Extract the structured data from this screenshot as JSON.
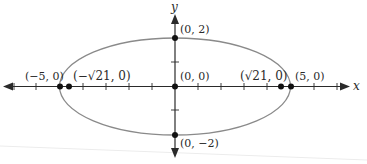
{
  "figure": {
    "type": "ellipse-with-foci",
    "equation_implied": "x^2/25 + y^2/4 = 1",
    "axes": {
      "x_label": "x",
      "y_label": "y",
      "x_ticks": [
        -7,
        -6,
        -5,
        -4,
        -3,
        -2,
        -1,
        1,
        2,
        3,
        4,
        5,
        6,
        7
      ],
      "y_ticks": [
        -2,
        -1,
        1,
        2
      ]
    },
    "ellipse": {
      "center": [
        0,
        0
      ],
      "a": 5,
      "b": 2
    },
    "points": [
      {
        "id": "vertex-left",
        "x": -5,
        "y": 0,
        "label": "(−5, 0)"
      },
      {
        "id": "focus-left",
        "x": -4.583,
        "y": 0,
        "label": "(−√21, 0)"
      },
      {
        "id": "center",
        "x": 0,
        "y": 0,
        "label": "(0, 0)"
      },
      {
        "id": "focus-right",
        "x": 4.583,
        "y": 0,
        "label": "(√21, 0)"
      },
      {
        "id": "vertex-right",
        "x": 5,
        "y": 0,
        "label": "(5, 0)"
      },
      {
        "id": "co-vertex-top",
        "x": 0,
        "y": 2,
        "label": "(0, 2)"
      },
      {
        "id": "co-vertex-bottom",
        "x": 0,
        "y": -2,
        "label": "(0, −2)"
      }
    ],
    "colors": {
      "axis": "#2a2a2a",
      "ellipse": "#8a8a8a",
      "points": "#111111",
      "text": "#2a2a2a"
    }
  }
}
